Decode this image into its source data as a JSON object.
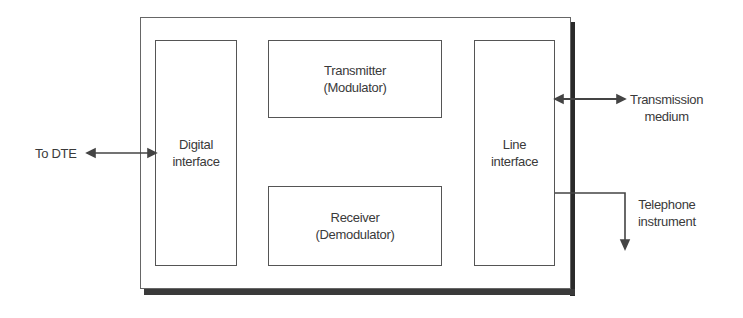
{
  "diagram": {
    "blocks": {
      "digital_interface": [
        "Digital",
        "interface"
      ],
      "transmitter": [
        "Transmitter",
        "(Modulator)"
      ],
      "receiver": [
        "Receiver",
        "(Demodulator)"
      ],
      "line_interface": [
        "Line",
        "interface"
      ]
    },
    "external": {
      "dte": "To DTE",
      "transmission_medium": [
        "Transmission",
        "medium"
      ],
      "telephone_instrument": [
        "Telephone",
        "instrument"
      ]
    },
    "connections": [
      {
        "from": "To DTE",
        "to": "Digital interface",
        "type": "bidirectional"
      },
      {
        "from": "Line interface",
        "to": "Transmission medium",
        "type": "bidirectional"
      },
      {
        "from": "Line interface",
        "to": "Telephone instrument",
        "type": "directed"
      }
    ],
    "colors": {
      "line": "#444444",
      "shadow": "#2a2a2a",
      "text": "#3a3a3a"
    }
  }
}
